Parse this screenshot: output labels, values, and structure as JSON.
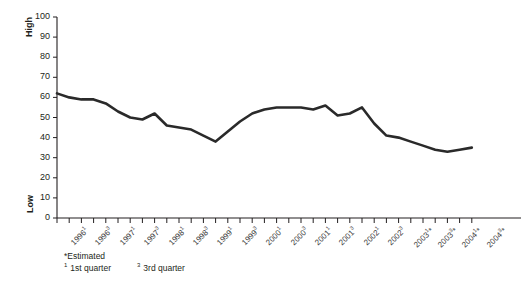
{
  "chart_data": {
    "type": "line",
    "title": "",
    "xlabel": "",
    "ylabel": "",
    "ylim": [
      0,
      100
    ],
    "ytick_values": [
      0,
      10,
      20,
      30,
      40,
      50,
      60,
      70,
      80,
      90,
      100
    ],
    "grid": false,
    "legend": "none",
    "axis_endpoint_labels": {
      "top": "High",
      "bottom": "Low"
    },
    "x": [
      "1996¹",
      "1996²",
      "1996³",
      "1996⁴",
      "1997¹",
      "1997²",
      "1997³",
      "1997⁴",
      "1998¹",
      "1998²",
      "1998³",
      "1998⁴",
      "1999¹",
      "1999²",
      "1999³",
      "1999⁴",
      "2000¹",
      "2000²",
      "2000³",
      "2000⁴",
      "2001¹",
      "2001²",
      "2001³",
      "2001⁴",
      "2002¹",
      "2002²",
      "2002³",
      "2002⁴",
      "2003¹*",
      "2003²*",
      "2003³*",
      "2003⁴*",
      "2004¹*",
      "2004²*",
      "2004³*"
    ],
    "values": [
      62,
      60,
      59,
      59,
      57,
      53,
      50,
      49,
      52,
      46,
      45,
      44,
      41,
      38,
      43,
      48,
      52,
      54,
      55,
      55,
      55,
      54,
      56,
      51,
      52,
      55,
      47,
      41,
      40,
      38,
      36,
      34,
      33,
      34,
      35
    ],
    "values_tail": [
      33,
      34,
      35,
      33,
      32
    ],
    "series_color": "#2a2a2a",
    "line_width": 2.6,
    "estimated_from": "2003¹*"
  },
  "y_axis": {
    "ticks": [
      "100",
      "90",
      "80",
      "70",
      "60",
      "50",
      "40",
      "30",
      "20",
      "10",
      "0"
    ],
    "high_label": "High",
    "low_label": "Low"
  },
  "x_axis": {
    "labels": [
      {
        "year": "1996",
        "quarter": "1",
        "est": ""
      },
      {
        "year": "1996",
        "quarter": "3",
        "est": ""
      },
      {
        "year": "1997",
        "quarter": "1",
        "est": ""
      },
      {
        "year": "1997",
        "quarter": "3",
        "est": ""
      },
      {
        "year": "1998",
        "quarter": "1",
        "est": ""
      },
      {
        "year": "1998",
        "quarter": "3",
        "est": ""
      },
      {
        "year": "1999",
        "quarter": "1",
        "est": ""
      },
      {
        "year": "1999",
        "quarter": "3",
        "est": ""
      },
      {
        "year": "2000",
        "quarter": "1",
        "est": ""
      },
      {
        "year": "2000",
        "quarter": "3",
        "est": ""
      },
      {
        "year": "2001",
        "quarter": "1",
        "est": ""
      },
      {
        "year": "2001",
        "quarter": "3",
        "est": ""
      },
      {
        "year": "2002",
        "quarter": "1",
        "est": ""
      },
      {
        "year": "2002",
        "quarter": "3",
        "est": ""
      },
      {
        "year": "2003",
        "quarter": "1",
        "est": "*"
      },
      {
        "year": "2003",
        "quarter": "3",
        "est": "*"
      },
      {
        "year": "2004",
        "quarter": "1",
        "est": "*"
      },
      {
        "year": "2004",
        "quarter": "3",
        "est": "*"
      }
    ]
  },
  "footnotes": {
    "estimated": "*Estimated",
    "q1_marker": "1",
    "q1_text": "1st quarter",
    "q3_marker": "3",
    "q3_text": "3rd quarter"
  }
}
